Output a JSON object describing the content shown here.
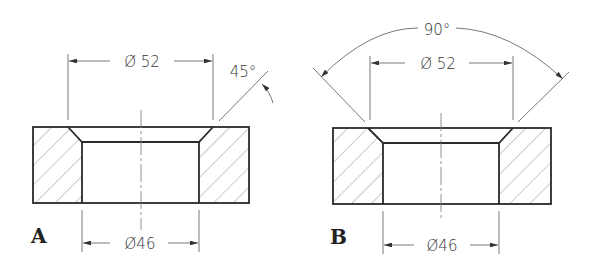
{
  "figure": {
    "panels": [
      {
        "id": "A",
        "label": "A",
        "top_dimension": "Ø 52",
        "bottom_dimension": "Ø46",
        "angle_dimension": "45°"
      },
      {
        "id": "B",
        "label": "B",
        "top_dimension": "Ø 52",
        "bottom_dimension": "Ø46",
        "angle_dimension": "90°"
      }
    ],
    "colors": {
      "outline": "#2a2a2a",
      "thin_line": "#555555",
      "hatch": "#888888",
      "background": "#ffffff"
    }
  }
}
